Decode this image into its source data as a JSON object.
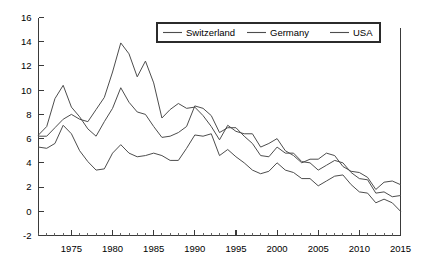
{
  "chart_data": {
    "type": "line",
    "title": "",
    "subtitle": "",
    "xlabel": "",
    "ylabel": "",
    "xlim": [
      1971,
      2015
    ],
    "ylim": [
      -2,
      16
    ],
    "grid": false,
    "legend_position": "top-center",
    "y_ticks": [
      "16",
      "14",
      "12",
      "10",
      "8",
      "6",
      "4",
      "2",
      "0",
      "-2"
    ],
    "y_tick_values": [
      16,
      14,
      12,
      10,
      8,
      6,
      4,
      2,
      0,
      -2
    ],
    "x_ticks": [
      "1975",
      "1980",
      "1985",
      "1990",
      "1995",
      "2000",
      "2005",
      "2010",
      "2015"
    ],
    "x_tick_values": [
      1975,
      1980,
      1985,
      1990,
      1995,
      2000,
      2005,
      2010,
      2015
    ],
    "x_minor_step": 1,
    "x": [
      1971,
      1972,
      1973,
      1974,
      1975,
      1976,
      1977,
      1978,
      1979,
      1980,
      1981,
      1982,
      1983,
      1984,
      1985,
      1986,
      1987,
      1988,
      1989,
      1990,
      1991,
      1992,
      1993,
      1994,
      1995,
      1996,
      1997,
      1998,
      1999,
      2000,
      2001,
      2002,
      2003,
      2004,
      2005,
      2006,
      2007,
      2008,
      2009,
      2010,
      2011,
      2012,
      2013,
      2014,
      2015
    ],
    "series": [
      {
        "name": "Switzerland",
        "color": "#4d4d4d",
        "values": [
          5.3,
          5.2,
          5.6,
          7.1,
          6.4,
          5.0,
          4.1,
          3.4,
          3.5,
          4.8,
          5.5,
          4.8,
          4.5,
          4.6,
          4.8,
          4.6,
          4.2,
          4.2,
          5.2,
          6.3,
          6.2,
          6.4,
          4.6,
          5.1,
          4.5,
          4.0,
          3.4,
          3.1,
          3.3,
          4.0,
          3.4,
          3.2,
          2.7,
          2.7,
          2.1,
          2.5,
          2.9,
          3.0,
          2.2,
          1.6,
          1.5,
          0.7,
          1.0,
          0.7,
          0.0
        ]
      },
      {
        "name": "Germany",
        "color": "#4d4d4d",
        "values": [
          6.3,
          7.0,
          9.3,
          10.4,
          8.6,
          7.8,
          6.8,
          6.2,
          7.4,
          8.5,
          10.2,
          9.0,
          8.2,
          8.0,
          7.0,
          6.1,
          6.2,
          6.5,
          7.0,
          8.7,
          8.5,
          7.9,
          6.5,
          6.9,
          6.9,
          6.2,
          5.6,
          4.6,
          4.5,
          5.3,
          4.8,
          4.8,
          4.1,
          4.0,
          3.4,
          3.8,
          4.2,
          4.0,
          3.2,
          2.7,
          2.6,
          1.5,
          1.6,
          1.2,
          1.3
        ]
      },
      {
        "name": "USA",
        "color": "#4d4d4d",
        "values": [
          6.2,
          6.2,
          6.9,
          7.6,
          8.0,
          7.6,
          7.4,
          8.4,
          9.4,
          11.5,
          13.9,
          13.0,
          11.1,
          12.4,
          10.6,
          7.7,
          8.4,
          8.9,
          8.5,
          8.6,
          7.9,
          7.0,
          5.9,
          7.1,
          6.6,
          6.4,
          6.4,
          5.3,
          5.6,
          6.0,
          5.0,
          4.6,
          4.0,
          4.3,
          4.3,
          4.8,
          4.6,
          3.7,
          3.3,
          3.2,
          2.8,
          1.8,
          2.4,
          2.5,
          2.2
        ]
      }
    ]
  },
  "legend": {
    "items": [
      {
        "label": "Switzerland"
      },
      {
        "label": "Germany"
      },
      {
        "label": "USA"
      }
    ]
  }
}
